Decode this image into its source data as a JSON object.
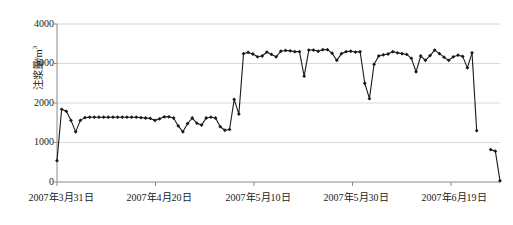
{
  "chart_data": {
    "type": "line",
    "title": "",
    "xlabel": "",
    "ylabel": "注浆量/m³",
    "ylabel_text": "注浆量/m",
    "ylabel_sup": "3",
    "ylim": [
      0,
      4000
    ],
    "ytick_labels": [
      "0",
      "1000",
      "2000",
      "3000",
      "4000"
    ],
    "ytick_values": [
      0,
      1000,
      2000,
      3000,
      4000
    ],
    "xtick_labels": [
      "2007年3月31日",
      "2007年4月20日",
      "2007年5月10日",
      "2007年5月30日",
      "2007年6月19日"
    ],
    "xtick_indices": [
      0,
      20,
      40,
      60,
      80
    ],
    "xlim": [
      0,
      84
    ],
    "grid": "horizontal",
    "legend": "none",
    "marker": "filled-diamond",
    "line_color": "#1a1a1a",
    "grid_color": "#d9d9d9",
    "axis_color": "#808080",
    "series": [
      {
        "name": "注浆量",
        "x": [
          0,
          1,
          2,
          3,
          4,
          5,
          6,
          7,
          8,
          9,
          10,
          11,
          12,
          13,
          14,
          15,
          16,
          17,
          18,
          19,
          20,
          21,
          22,
          23,
          24,
          25,
          26,
          27,
          28,
          29,
          30,
          31,
          32,
          33,
          34,
          35,
          36,
          37,
          38,
          39,
          40,
          41,
          42,
          43,
          44,
          45,
          46,
          47,
          48,
          49,
          50,
          51,
          52,
          53,
          54,
          55,
          56,
          57,
          58,
          59,
          60,
          61,
          62,
          63,
          64,
          65,
          66,
          67,
          68,
          69,
          70,
          71,
          72,
          73,
          74,
          75,
          76,
          77,
          78
        ],
        "values": [
          540,
          1840,
          1790,
          1560,
          1270,
          1560,
          1630,
          1640,
          1640,
          1640,
          1640,
          1640,
          1640,
          1640,
          1640,
          1640,
          1640,
          1640,
          1630,
          1620,
          1610,
          1560,
          1600,
          1650,
          1650,
          1620,
          1420,
          1270,
          1480,
          1620,
          1490,
          1440,
          1620,
          1640,
          1620,
          1400,
          1310,
          1330,
          2090,
          1720,
          3250,
          3280,
          3240,
          3170,
          3190,
          3290,
          3230,
          3170,
          3310,
          3330,
          3320,
          3300,
          3300,
          2680,
          3340,
          3340,
          3310,
          3350,
          3350,
          3260,
          3080,
          3250,
          3300,
          3310,
          3290,
          3300,
          2500,
          2110,
          2980,
          3190,
          3220,
          3240,
          3300,
          3270,
          3250,
          3230,
          3130,
          2790,
          3190
        ]
      },
      {
        "name": "注浆量-续",
        "x": [
          79,
          80,
          81,
          82,
          83,
          84,
          85
        ],
        "values": [
          3080,
          3200,
          3340,
          3250,
          3160,
          3080,
          3170
        ]
      },
      {
        "name": "注浆量-尾段",
        "x": [
          86,
          87,
          88,
          89
        ],
        "values": [
          3210,
          3180,
          2890,
          3270
        ]
      },
      {
        "name": "注浆量-收尾",
        "x": [
          90
        ],
        "values": [
          1300
        ]
      },
      {
        "name": "注浆量-末段",
        "x": [
          93,
          94,
          95
        ],
        "values": [
          820,
          780,
          30
        ]
      }
    ],
    "data_points_note": "single continuous black polyline with filled diamond markers"
  }
}
